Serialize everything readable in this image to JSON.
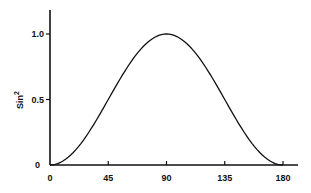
{
  "chart_data": {
    "type": "line",
    "title": "",
    "xlabel": "",
    "ylabel": "Sin",
    "ylabel_superscript": "2",
    "xlim": [
      0,
      180
    ],
    "ylim": [
      0,
      1.2
    ],
    "grid": false,
    "legend": null,
    "x_ticks": [
      "0",
      "45",
      "90",
      "135",
      "180"
    ],
    "y_ticks": [
      "0",
      "0.5",
      "1.0"
    ],
    "series": [
      {
        "name": "sin^2",
        "x": [
          0,
          15,
          30,
          45,
          60,
          75,
          90,
          105,
          120,
          135,
          150,
          165,
          180
        ],
        "y": [
          0,
          0.067,
          0.25,
          0.5,
          0.75,
          0.933,
          1.0,
          0.933,
          0.75,
          0.5,
          0.25,
          0.067,
          0
        ]
      }
    ]
  },
  "colors": {
    "line": "#111111",
    "axis": "#111111",
    "background": "#ffffff"
  }
}
